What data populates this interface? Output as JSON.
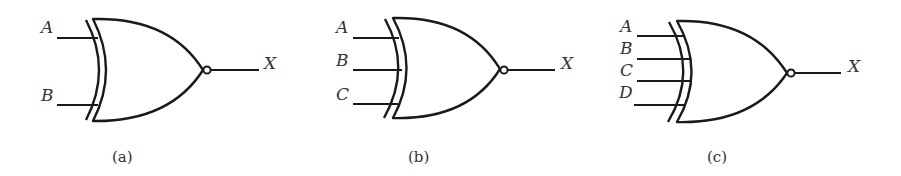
{
  "figure": {
    "gates": [
      {
        "id": "a",
        "type": "XNOR",
        "caption": "(a)",
        "inputs": [
          "A",
          "B"
        ],
        "output": "X"
      },
      {
        "id": "b",
        "type": "XNOR",
        "caption": "(b)",
        "inputs": [
          "A",
          "B",
          "C"
        ],
        "output": "X"
      },
      {
        "id": "c",
        "type": "XNOR",
        "caption": "(c)",
        "inputs": [
          "A",
          "B",
          "C",
          "D"
        ],
        "output": "X"
      }
    ]
  },
  "colors": {
    "stroke": "#1a1a1a",
    "text": "#333333",
    "background": "#ffffff"
  }
}
